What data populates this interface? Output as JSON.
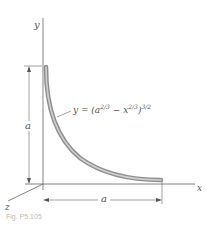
{
  "figure": {
    "axis_labels": {
      "x": "x",
      "y": "y",
      "z": "z"
    },
    "dimension_labels": {
      "vertical": "a",
      "horizontal": "a"
    },
    "equation": {
      "lhs": "y = (a",
      "exp1": "2/3",
      "mid": " − x",
      "exp2": "2/3",
      "close": ")",
      "exp3": "3/2"
    },
    "caption": "Fig. P5.105",
    "colors": {
      "rod": "#9a9a9a",
      "rod_highlight": "#d0d0d0",
      "lines": "#555555"
    }
  }
}
